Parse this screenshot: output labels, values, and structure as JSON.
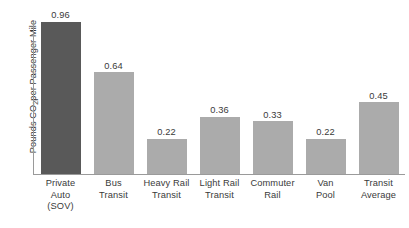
{
  "chart_data": {
    "type": "bar",
    "title": "",
    "subtitle": "",
    "xlabel": "",
    "ylabel": "Pounds CO2 per Passenger Mile",
    "ylabel_parts": {
      "prefix": "Pounds CO",
      "sub": "2",
      "suffix": " per Passenger Mile"
    },
    "categories": [
      "Private Auto (SOV)",
      "Bus Transit",
      "Heavy Rail Transit",
      "Light Rail Transit",
      "Commuter Rail",
      "Van Pool",
      "Transit Average"
    ],
    "category_lines": [
      [
        "Private",
        "Auto",
        "(SOV)"
      ],
      [
        "Bus",
        "Transit"
      ],
      [
        "Heavy Rail",
        "Transit"
      ],
      [
        "Light Rail",
        "Transit"
      ],
      [
        "Commuter",
        "Rail"
      ],
      [
        "Van",
        "Pool"
      ],
      [
        "Transit",
        "Average"
      ]
    ],
    "values": [
      0.96,
      0.64,
      0.22,
      0.36,
      0.33,
      0.22,
      0.45
    ],
    "value_labels": [
      "0.96",
      "0.64",
      "0.22",
      "0.36",
      "0.33",
      "0.22",
      "0.45"
    ],
    "bar_colors": [
      "#595959",
      "#ababab",
      "#ababab",
      "#ababab",
      "#ababab",
      "#ababab",
      "#ababab"
    ],
    "ylim": [
      0,
      1.0
    ],
    "grid": false,
    "legend": false,
    "y_ticks": [],
    "axis_color": "#9a9a9a",
    "text_color": "#3a3a3a",
    "background": "#ffffff"
  }
}
